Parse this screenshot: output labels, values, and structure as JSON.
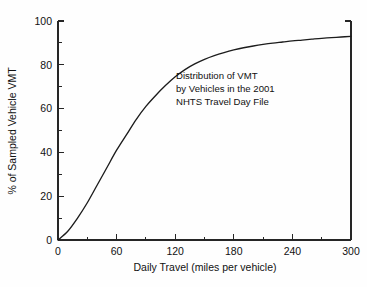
{
  "chart_data": {
    "type": "line",
    "title": "",
    "subtitle": "",
    "xlabel": "Daily Travel (miles per vehicle)",
    "ylabel": "% of Sampled Vehicle VMT",
    "xlim": [
      0,
      300
    ],
    "ylim": [
      0,
      100
    ],
    "grid": false,
    "legend": "none",
    "x_major_ticks": [
      0,
      60,
      120,
      180,
      240,
      300
    ],
    "x_minor_interval": 30,
    "y_major_ticks": [
      0,
      20,
      40,
      60,
      80,
      100
    ],
    "y_minor_interval": 10,
    "x_tick_labels": [
      "0",
      "60",
      "120",
      "180",
      "240",
      "300"
    ],
    "y_tick_labels": [
      "0",
      "20",
      "40",
      "60",
      "80",
      "100"
    ],
    "series": [
      {
        "name": "Cumulative % of sampled vehicle VMT",
        "x": [
          0,
          10,
          20,
          30,
          40,
          50,
          60,
          70,
          80,
          90,
          100,
          110,
          120,
          130,
          140,
          150,
          160,
          170,
          180,
          190,
          200,
          210,
          220,
          230,
          240,
          250,
          260,
          270,
          280,
          290,
          300
        ],
        "values": [
          0,
          4,
          10,
          17,
          25,
          33,
          41,
          48,
          55,
          61,
          66,
          70.5,
          74.5,
          77.8,
          80.4,
          82.5,
          84.2,
          85.6,
          86.8,
          87.8,
          88.6,
          89.3,
          89.9,
          90.4,
          90.9,
          91.3,
          91.7,
          92.1,
          92.4,
          92.7,
          93
        ]
      }
    ],
    "annotations": [
      {
        "name": "chart-annotation",
        "lines": [
          "Distribution of VMT",
          "by Vehicles in the 2001",
          "NHTS Travel Day File"
        ],
        "x": 105,
        "y": 72
      }
    ],
    "colors": {
      "line": "#1c1c1c",
      "axis": "#262626",
      "text": "#111111",
      "background": "#fefefe"
    }
  }
}
